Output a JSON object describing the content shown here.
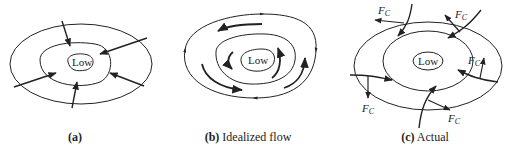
{
  "panels": [
    {
      "id": "a",
      "center_label": "Low",
      "caption_letter": "(a)",
      "caption_text": ""
    },
    {
      "id": "b",
      "center_label": "Low",
      "caption_letter": "(b)",
      "caption_text": "Idealized flow"
    },
    {
      "id": "c",
      "center_label": "Low",
      "caption_letter": "(c)",
      "caption_text": "Actual",
      "force_label": "F",
      "force_subscript": "C"
    }
  ],
  "colors": {
    "ink": "#222222",
    "background": "#ffffff"
  }
}
